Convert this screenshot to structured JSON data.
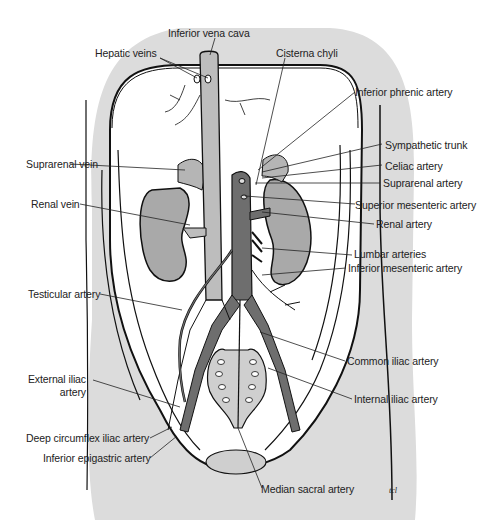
{
  "diagram": {
    "colors": {
      "body_fill": "#dcdcdc",
      "cavity_fill": "#ffffff",
      "vein_fill": "#bdbdbd",
      "artery_fill": "#6e6e6e",
      "kidney_fill": "#a9a9a9",
      "adrenal_fill": "#b5b5b5",
      "outline": "#111111",
      "leader": "#222222"
    },
    "labels": {
      "inferior_vena_cava": "Inferior vena cava",
      "hepatic_veins": "Hepatic veins",
      "cisterna_chyli": "Cisterna chyli",
      "inferior_phrenic_artery": "Inferior phrenic artery",
      "sympathetic_trunk": "Sympathetic trunk",
      "celiac_artery": "Celiac artery",
      "suprarenal_artery": "Suprarenal artery",
      "superior_mesenteric_artery": "Superior mesenteric artery",
      "renal_artery": "Renal artery",
      "lumbar_arteries": "Lumbar arteries",
      "inferior_mesenteric_artery": "Inferior mesenteric artery",
      "suprarenal_vein": "Suprarenal vein",
      "renal_vein": "Renal vein",
      "testicular_artery": "Testicular artery",
      "common_iliac_artery": "Common iliac artery",
      "internal_iliac_artery": "Internal iliac artery",
      "external_iliac_artery_line1": "External iliac",
      "external_iliac_artery_line2": "artery",
      "deep_circumflex_iliac_artery": "Deep circumflex iliac artery",
      "inferior_epigastric_artery": "Inferior epigastric artery",
      "median_sacral_artery": "Median sacral artery"
    },
    "signature": "tcl"
  }
}
